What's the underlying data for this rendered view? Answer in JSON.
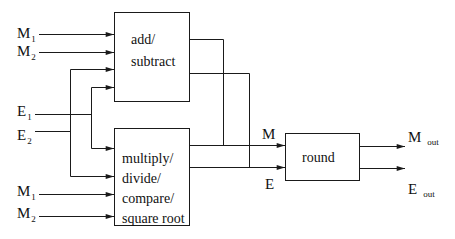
{
  "diagram": {
    "type": "block-diagram",
    "blocks": {
      "add_subtract": {
        "lines": [
          "add/",
          "subtract"
        ]
      },
      "multiply_divide": {
        "lines": [
          "multiply/",
          "divide/",
          "compare/",
          "square root"
        ]
      },
      "round": {
        "label": "round"
      }
    },
    "inputs": {
      "top_m1": {
        "main": "M",
        "sub": "1"
      },
      "top_m2": {
        "main": "M",
        "sub": "2"
      },
      "e1": {
        "main": "E",
        "sub": "1"
      },
      "e2": {
        "main": "E",
        "sub": "2"
      },
      "bottom_m1": {
        "main": "M",
        "sub": "1"
      },
      "bottom_m2": {
        "main": "M",
        "sub": "2"
      }
    },
    "intermediate": {
      "m": "M",
      "e": "E"
    },
    "outputs": {
      "m_out": {
        "main": "M",
        "sub": "out"
      },
      "e_out": {
        "main": "E",
        "sub": "out"
      }
    },
    "colors": {
      "stroke": "#1a1a1a",
      "background": "#ffffff"
    }
  }
}
